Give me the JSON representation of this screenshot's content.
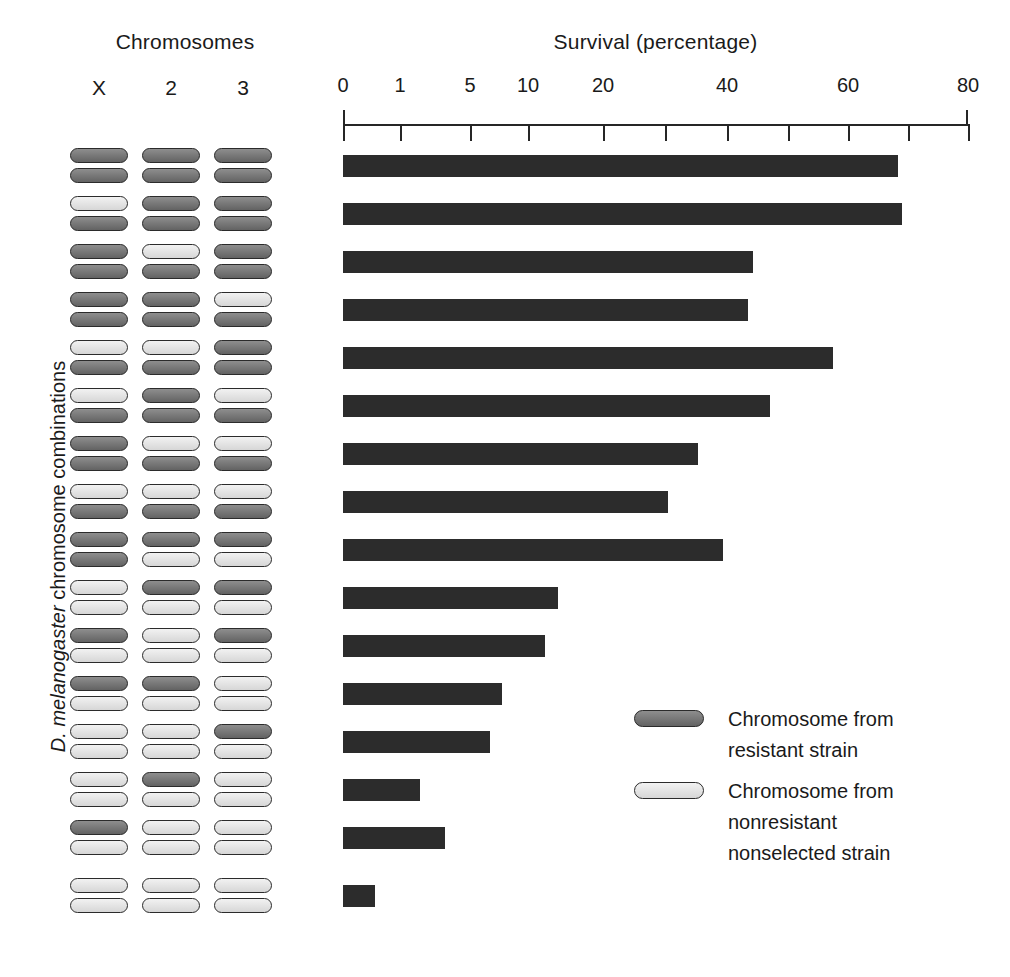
{
  "headings": {
    "chromosomes": "Chromosomes",
    "survival": "Survival (percentage)",
    "y_axis": {
      "italic_part": "D. melanogaster",
      "plain_part": " chromosome combinations"
    }
  },
  "chromosome_columns": [
    "X",
    "2",
    "3"
  ],
  "legend": {
    "entries": [
      {
        "swatch": "resistant",
        "line1": "Chromosome from",
        "line2": "resistant strain",
        "line3": ""
      },
      {
        "swatch": "nonresistant",
        "line1": "Chromosome from",
        "line2": "nonresistant",
        "line3": "nonselected strain"
      }
    ]
  },
  "colors": {
    "resistant_chromosome": "#6e6e6e",
    "nonresistant_chromosome": "#e2e2e2",
    "chromosome_outline": "#2b2b2b",
    "bar_fill": "#2c2c2c",
    "axis": "#262626",
    "background": "#ffffff"
  },
  "chart_data": {
    "type": "bar",
    "orientation": "horizontal",
    "title": "Survival (percentage)",
    "xlabel": "Survival (percentage)",
    "ylabel": "D. melanogaster chromosome combinations",
    "x_scale": "nonlinear (compressed at low values)",
    "xlim": [
      0,
      80
    ],
    "grid": false,
    "legend_position": "inside-right",
    "tick_labels": [
      "0",
      "1",
      "5",
      "10",
      "20",
      "",
      "40",
      "",
      "60",
      "",
      "80"
    ],
    "tick_values": [
      0,
      1,
      5,
      10,
      20,
      30,
      40,
      50,
      60,
      70,
      80
    ],
    "tick_positions_px": [
      0,
      57,
      127,
      185,
      260,
      322,
      384,
      445,
      505,
      565,
      625
    ],
    "categories": [
      "X: R/R  2: R/R  3: R/R",
      "X: N/R  2: R/R  3: R/R",
      "X: R/R  2: N/R  3: R/R",
      "X: R/R  2: R/R  3: N/R",
      "X: N/R  2: R/R  3: N/R",
      "X: R/R  2: N/N  3: N/R",
      "X: N/R  2: N/N  3: N/R",
      "X: N/N  2: N/R  3: N/R",
      "X: N/R  2: R/N  3: N/N",
      "X: N/N  2: N/N  3: N/N",
      "X: R/N  2: N/N  3: R/N",
      "X: R/N  2: R/N  3: N/N",
      "X: N/N  2: N/N  3: R/N",
      "X: N/N  2: R/N  3: N/N",
      "X: R/N  2: N/N  3: N/N",
      "X: N/N  2: N/N  3: N/N"
    ],
    "values": [
      68,
      68.5,
      42,
      41,
      57,
      45,
      32,
      25,
      39,
      14,
      12,
      7.5,
      6.5,
      1.6,
      3,
      0.6
    ],
    "bar_end_px": [
      555,
      559,
      410,
      405,
      490,
      427,
      355,
      325,
      380,
      215,
      202,
      159,
      147,
      77,
      102,
      32
    ],
    "rows": [
      {
        "index": 0,
        "chromosomes": [
          [
            "resistant",
            "resistant"
          ],
          [
            "resistant",
            "resistant"
          ],
          [
            "resistant",
            "resistant"
          ]
        ],
        "value": 68
      },
      {
        "index": 1,
        "chromosomes": [
          [
            "nonresistant",
            "resistant"
          ],
          [
            "resistant",
            "resistant"
          ],
          [
            "resistant",
            "resistant"
          ]
        ],
        "value": 68.5
      },
      {
        "index": 2,
        "chromosomes": [
          [
            "resistant",
            "resistant"
          ],
          [
            "nonresistant",
            "resistant"
          ],
          [
            "resistant",
            "resistant"
          ]
        ],
        "value": 42
      },
      {
        "index": 3,
        "chromosomes": [
          [
            "resistant",
            "resistant"
          ],
          [
            "resistant",
            "resistant"
          ],
          [
            "nonresistant",
            "resistant"
          ]
        ],
        "value": 41
      },
      {
        "index": 4,
        "chromosomes": [
          [
            "nonresistant",
            "resistant"
          ],
          [
            "nonresistant",
            "resistant"
          ],
          [
            "resistant",
            "resistant"
          ]
        ],
        "value": 57
      },
      {
        "index": 5,
        "chromosomes": [
          [
            "nonresistant",
            "resistant"
          ],
          [
            "resistant",
            "resistant"
          ],
          [
            "nonresistant",
            "resistant"
          ]
        ],
        "value": 45
      },
      {
        "index": 6,
        "chromosomes": [
          [
            "resistant",
            "resistant"
          ],
          [
            "nonresistant",
            "resistant"
          ],
          [
            "nonresistant",
            "resistant"
          ]
        ],
        "value": 32
      },
      {
        "index": 7,
        "chromosomes": [
          [
            "nonresistant",
            "resistant"
          ],
          [
            "nonresistant",
            "resistant"
          ],
          [
            "nonresistant",
            "resistant"
          ]
        ],
        "value": 25
      },
      {
        "index": 8,
        "chromosomes": [
          [
            "resistant",
            "resistant"
          ],
          [
            "resistant",
            "nonresistant"
          ],
          [
            "resistant",
            "nonresistant"
          ]
        ],
        "value": 39
      },
      {
        "index": 9,
        "chromosomes": [
          [
            "nonresistant",
            "nonresistant"
          ],
          [
            "resistant",
            "nonresistant"
          ],
          [
            "resistant",
            "nonresistant"
          ]
        ],
        "value": 14
      },
      {
        "index": 10,
        "chromosomes": [
          [
            "resistant",
            "nonresistant"
          ],
          [
            "nonresistant",
            "nonresistant"
          ],
          [
            "resistant",
            "nonresistant"
          ]
        ],
        "value": 12
      },
      {
        "index": 11,
        "chromosomes": [
          [
            "resistant",
            "nonresistant"
          ],
          [
            "resistant",
            "nonresistant"
          ],
          [
            "nonresistant",
            "nonresistant"
          ]
        ],
        "value": 7.5
      },
      {
        "index": 12,
        "chromosomes": [
          [
            "nonresistant",
            "nonresistant"
          ],
          [
            "nonresistant",
            "nonresistant"
          ],
          [
            "resistant",
            "nonresistant"
          ]
        ],
        "value": 6.5
      },
      {
        "index": 13,
        "chromosomes": [
          [
            "nonresistant",
            "nonresistant"
          ],
          [
            "resistant",
            "nonresistant"
          ],
          [
            "nonresistant",
            "nonresistant"
          ]
        ],
        "value": 1.6
      },
      {
        "index": 14,
        "chromosomes": [
          [
            "resistant",
            "nonresistant"
          ],
          [
            "nonresistant",
            "nonresistant"
          ],
          [
            "nonresistant",
            "nonresistant"
          ]
        ],
        "value": 3
      },
      {
        "index": 15,
        "chromosomes": [
          [
            "nonresistant",
            "nonresistant"
          ],
          [
            "nonresistant",
            "nonresistant"
          ],
          [
            "nonresistant",
            "nonresistant"
          ]
        ],
        "value": 0.6
      }
    ],
    "row_top_px": [
      0,
      48,
      96,
      144,
      192,
      240,
      288,
      336,
      384,
      432,
      480,
      528,
      576,
      624,
      672,
      730
    ]
  }
}
